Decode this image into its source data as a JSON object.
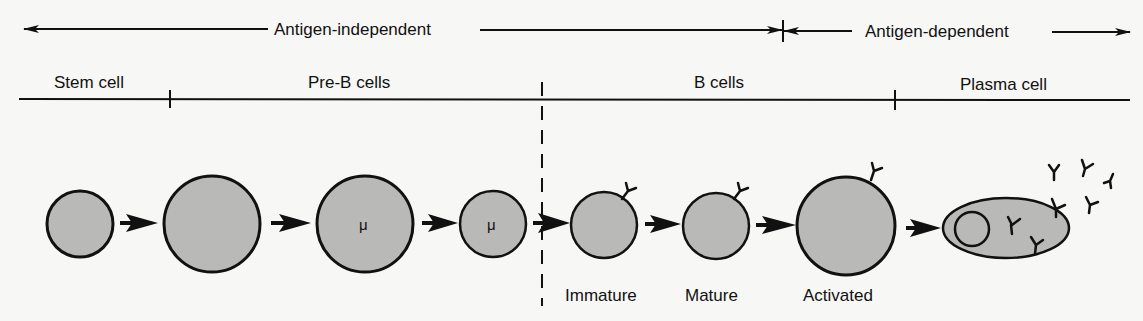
{
  "colors": {
    "background": "#f7f7f5",
    "line": "#111111",
    "cell_fill": "#b9b9b7"
  },
  "phases": {
    "antigen_independent": "Antigen-independent",
    "antigen_dependent": "Antigen-dependent"
  },
  "stages": {
    "stem_cell": "Stem cell",
    "pre_b_cells": "Pre-B cells",
    "b_cells": "B cells",
    "plasma_cell": "Plasma cell"
  },
  "cells": [
    {
      "id": "stem",
      "cx": 80,
      "cy": 224,
      "r": 33,
      "label": "",
      "marker": ""
    },
    {
      "id": "pre-b-large",
      "cx": 212,
      "cy": 224,
      "r": 48,
      "label": "",
      "marker": ""
    },
    {
      "id": "pre-b-mu-large",
      "cx": 365,
      "cy": 224,
      "r": 48,
      "label": "",
      "marker": "μ"
    },
    {
      "id": "pre-b-mu-small",
      "cx": 493,
      "cy": 224,
      "r": 33,
      "label": "",
      "marker": "μ"
    },
    {
      "id": "immature",
      "cx": 604,
      "cy": 224,
      "r": 33,
      "label": "Immature",
      "marker": ""
    },
    {
      "id": "mature",
      "cx": 715,
      "cy": 224,
      "r": 33,
      "label": "Mature",
      "marker": ""
    },
    {
      "id": "activated",
      "cx": 846,
      "cy": 224,
      "r": 49,
      "label": "Activated",
      "marker": ""
    }
  ],
  "cell_labels": {
    "immature": "Immature",
    "mature": "Mature",
    "activated": "Activated"
  },
  "markers": {
    "mu": "μ"
  },
  "icons": {
    "antibody": "Y-shaped antibody glyph",
    "arrow": "solid arrowhead"
  }
}
